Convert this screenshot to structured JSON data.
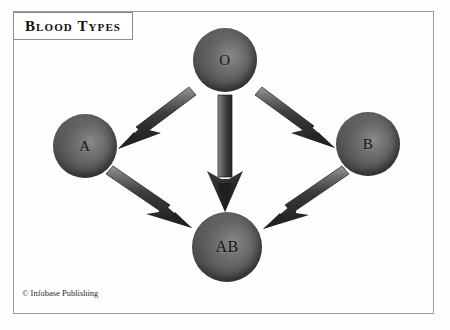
{
  "title": {
    "text": "Blood Types"
  },
  "credit": {
    "text": "© Infobase Publishing"
  },
  "diagram": {
    "type": "directed-graph",
    "nodes": [
      {
        "id": "O",
        "label": "O",
        "cx": 225,
        "cy": 60,
        "r": 32
      },
      {
        "id": "A",
        "label": "A",
        "cx": 85,
        "cy": 146,
        "r": 32
      },
      {
        "id": "B",
        "label": "B",
        "cx": 368,
        "cy": 144,
        "r": 32
      },
      {
        "id": "AB",
        "label": "AB",
        "cx": 227,
        "cy": 247,
        "r": 35
      }
    ],
    "edges": [
      {
        "from": "O",
        "to": "A",
        "name": "arrow-o-to-a"
      },
      {
        "from": "O",
        "to": "AB",
        "name": "arrow-o-to-ab"
      },
      {
        "from": "O",
        "to": "B",
        "name": "arrow-o-to-b"
      },
      {
        "from": "A",
        "to": "AB",
        "name": "arrow-a-to-ab"
      },
      {
        "from": "B",
        "to": "AB",
        "name": "arrow-b-to-ab"
      }
    ]
  },
  "colors": {
    "background": "#fdfdfd",
    "frame_border": "#9a9a9a",
    "sphere_dark": "#343434",
    "sphere_light": "#8a8a8a",
    "arrow_fill": "#2f2f2f",
    "arrow_highlight": "#8f8f8f",
    "text": "#111111"
  }
}
